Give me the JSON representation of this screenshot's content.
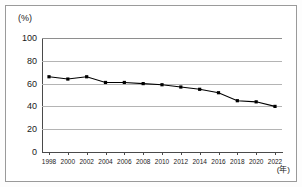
{
  "figure": {
    "unit_label": "(%)",
    "xaxis_unit_label": "(年)"
  },
  "chart_data": {
    "type": "line",
    "title": "",
    "subtitle": "",
    "xlabel": "(年)",
    "ylabel": "(%)",
    "categories": [
      "1998",
      "2000",
      "2002",
      "2004",
      "2006",
      "2008",
      "2010",
      "2012",
      "2014",
      "2016",
      "2018",
      "2020",
      "2022"
    ],
    "x": [
      1998,
      2000,
      2002,
      2004,
      2006,
      2008,
      2010,
      2012,
      2014,
      2016,
      2018,
      2020,
      2022
    ],
    "values": [
      66,
      64,
      66,
      61,
      61,
      60,
      59,
      57,
      55,
      52,
      45,
      44,
      40
    ],
    "series": [
      {
        "name": "",
        "values": [
          66,
          64,
          66,
          61,
          61,
          60,
          59,
          57,
          55,
          52,
          45,
          44,
          40
        ]
      }
    ],
    "ylim": [
      0,
      100
    ],
    "yticks": [
      0,
      20,
      40,
      60,
      80,
      100
    ],
    "ytick_labels": [
      "0",
      "20",
      "40",
      "60",
      "80",
      "100"
    ],
    "xtick_labels": [
      "1998",
      "2000",
      "2002",
      "2004",
      "2006",
      "2008",
      "2010",
      "2012",
      "2014",
      "2016",
      "2018",
      "2020",
      "2022"
    ],
    "xlim": [
      1998,
      2022
    ],
    "grid": true,
    "grid_axis": "y",
    "legend": false,
    "legend_position": "none",
    "marker": "square",
    "line_color": "#000000",
    "marker_color": "#000000",
    "gridline_color": "#b4b4b4",
    "axis_color": "#4a4a4a",
    "background_color": "#ffffff"
  }
}
